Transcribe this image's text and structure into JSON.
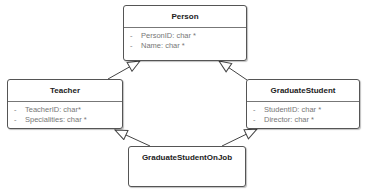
{
  "diagram": {
    "type": "UML class diagram",
    "classes": [
      {
        "name": "Person",
        "attributes": [
          {
            "visibility": "-",
            "text": "PersonID: char *"
          },
          {
            "visibility": "-",
            "text": "Name: char *"
          }
        ]
      },
      {
        "name": "Teacher",
        "attributes": [
          {
            "visibility": "-",
            "text": "TeacherID: char*"
          },
          {
            "visibility": "-",
            "text": "Specialities: char *"
          }
        ]
      },
      {
        "name": "GraduateStudent",
        "attributes": [
          {
            "visibility": "-",
            "text": "StudentID: char *"
          },
          {
            "visibility": "-",
            "text": "Director: char *"
          }
        ]
      },
      {
        "name": "GraduateStudentOnJob",
        "attributes": []
      }
    ],
    "relations": [
      {
        "from": "Teacher",
        "to": "Person",
        "type": "generalization"
      },
      {
        "from": "GraduateStudent",
        "to": "Person",
        "type": "generalization"
      },
      {
        "from": "GraduateStudentOnJob",
        "to": "Teacher",
        "type": "generalization"
      },
      {
        "from": "GraduateStudentOnJob",
        "to": "GraduateStudent",
        "type": "generalization"
      }
    ],
    "colors": {
      "border": "#555555",
      "text": "#222222",
      "attr_text": "#777777"
    }
  }
}
